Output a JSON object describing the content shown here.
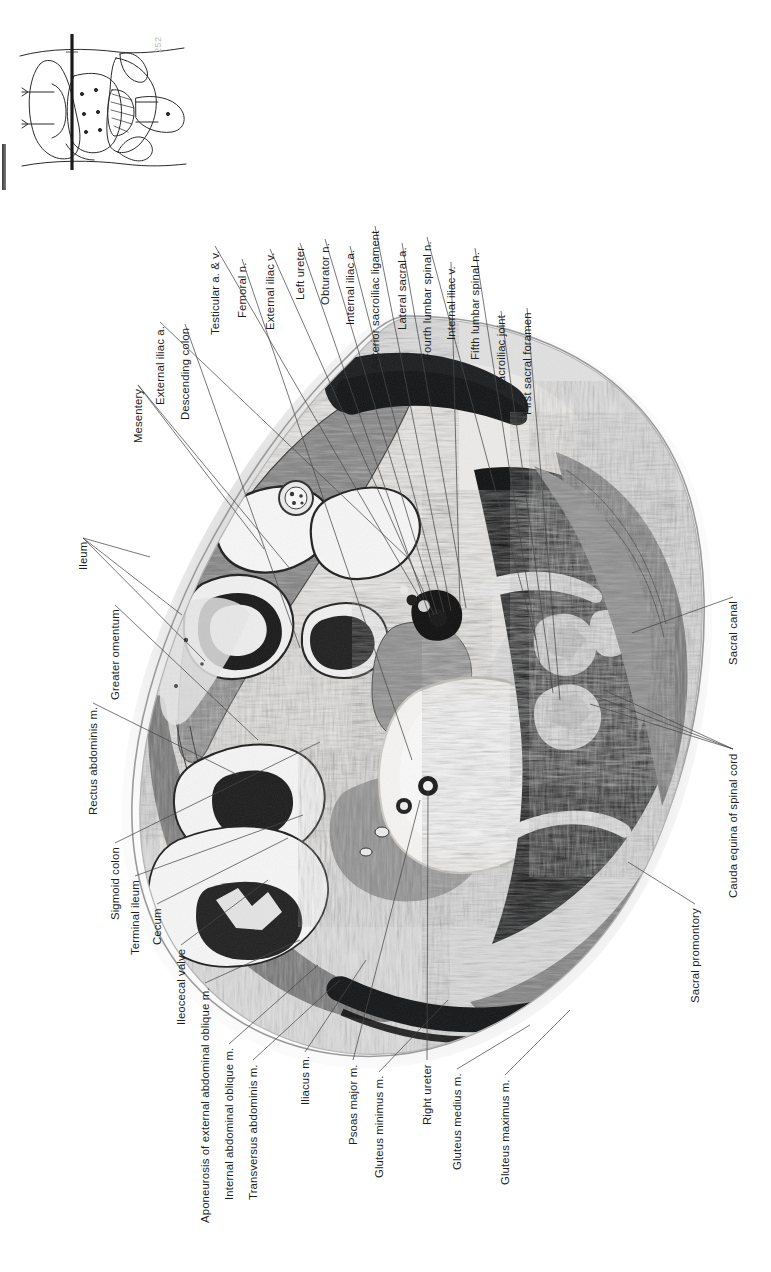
{
  "plate": {
    "title": "Transverse section of male pelvis at level of sacral promontory",
    "folio": "252",
    "inset_caption": "section level indicator"
  },
  "labels": [
    {
      "id": "ileum",
      "text": "Ileum",
      "x": 78,
      "y": 570,
      "anchors": [
        [
          150,
          557
        ],
        [
          182,
          615
        ],
        [
          205,
          661
        ]
      ]
    },
    {
      "id": "greater-omentum",
      "text": "Greater omentum",
      "x": 110,
      "y": 700,
      "anchors": [
        [
          258,
          740
        ]
      ]
    },
    {
      "id": "rectus-abdominis",
      "text": "Rectus abdominis m.",
      "x": 88,
      "y": 815,
      "anchors": [
        [
          238,
          775
        ]
      ]
    },
    {
      "id": "sigmoid-colon",
      "text": "Sigmoid colon",
      "x": 110,
      "y": 920,
      "anchors": [
        [
          320,
          742
        ]
      ]
    },
    {
      "id": "terminal-ileum",
      "text": "Terminal ileum",
      "x": 130,
      "y": 955,
      "anchors": [
        [
          303,
          815
        ]
      ]
    },
    {
      "id": "cecum",
      "text": "Cecum",
      "x": 152,
      "y": 945,
      "anchors": [
        [
          288,
          838
        ]
      ]
    },
    {
      "id": "ileocecal-valve",
      "text": "Ileocecal valve",
      "x": 176,
      "y": 1025,
      "anchors": [
        [
          268,
          880
        ]
      ]
    },
    {
      "id": "aponeurosis-eo",
      "text": "Aponeurosis of external abdominal oblique m.",
      "x": 200,
      "y": 1223,
      "anchors": [
        [
          300,
          940
        ]
      ]
    },
    {
      "id": "internal-oblique",
      "text": "Internal abdominal oblique m.",
      "x": 224,
      "y": 1200,
      "anchors": [
        [
          318,
          965
        ]
      ]
    },
    {
      "id": "transversus-abdominis",
      "text": "Transversus abdominis m.",
      "x": 248,
      "y": 1200,
      "anchors": [
        [
          340,
          980
        ]
      ]
    },
    {
      "id": "iliacus",
      "text": "Iliacus m.",
      "x": 300,
      "y": 1105,
      "anchors": [
        [
          366,
          960
        ]
      ]
    },
    {
      "id": "psoas-major",
      "text": "Psoas major m.",
      "x": 348,
      "y": 1145,
      "anchors": [
        [
          420,
          800
        ]
      ]
    },
    {
      "id": "gluteus-minimus",
      "text": "Gluteus minimus m.",
      "x": 374,
      "y": 1178,
      "anchors": [
        [
          448,
          1000
        ]
      ]
    },
    {
      "id": "right-ureter",
      "text": "Right ureter",
      "x": 422,
      "y": 1125,
      "anchors": [
        [
          428,
          790
        ]
      ]
    },
    {
      "id": "gluteus-medius",
      "text": "Gluteus medius m.",
      "x": 452,
      "y": 1170,
      "anchors": [
        [
          530,
          1025
        ]
      ]
    },
    {
      "id": "gluteus-maximus",
      "text": "Gluteus maximus m.",
      "x": 500,
      "y": 1185,
      "anchors": [
        [
          570,
          1010
        ]
      ]
    },
    {
      "id": "mesentery",
      "text": "Mesentery",
      "x": 133,
      "y": 443,
      "anchors": [
        [
          264,
          549
        ],
        [
          291,
          570
        ]
      ]
    },
    {
      "id": "external-iliac-a",
      "text": "External iliac a.",
      "x": 155,
      "y": 405,
      "anchors": [
        [
          410,
          560
        ]
      ]
    },
    {
      "id": "descending-colon",
      "text": "Descending colon",
      "x": 180,
      "y": 420,
      "anchors": [
        [
          300,
          648
        ]
      ]
    },
    {
      "id": "testicular-av",
      "text": "Testicular a. & v.",
      "x": 210,
      "y": 335,
      "anchors": [
        [
          421,
          600
        ]
      ]
    },
    {
      "id": "femoral-n",
      "text": "Femoral n.",
      "x": 237,
      "y": 318,
      "anchors": [
        [
          412,
          760
        ]
      ]
    },
    {
      "id": "external-iliac-v",
      "text": "External iliac v.",
      "x": 265,
      "y": 330,
      "anchors": [
        [
          434,
          615
        ]
      ]
    },
    {
      "id": "left-ureter",
      "text": "Left ureter",
      "x": 295,
      "y": 300,
      "anchors": [
        [
          430,
          617
        ]
      ]
    },
    {
      "id": "obturator-n",
      "text": "Obturator n.",
      "x": 320,
      "y": 305,
      "anchors": [
        [
          437,
          614
        ]
      ]
    },
    {
      "id": "internal-iliac-a",
      "text": "Internal iliac a.",
      "x": 345,
      "y": 325,
      "anchors": [
        [
          444,
          612
        ]
      ]
    },
    {
      "id": "anterior-si-ligament",
      "text": "Anterior sacroiliac ligament",
      "x": 370,
      "y": 370,
      "anchors": [
        [
          451,
          611
        ]
      ]
    },
    {
      "id": "lateral-sacral-a",
      "text": "Lateral sacral a.",
      "x": 397,
      "y": 330,
      "anchors": [
        [
          466,
          608
        ]
      ]
    },
    {
      "id": "fourth-lumbar-spinal-n",
      "text": "Fourth lumbar spinal n.",
      "x": 422,
      "y": 360,
      "anchors": [
        [
          536,
          640
        ]
      ]
    },
    {
      "id": "internal-iliac-v",
      "text": "Internal iliac v.",
      "x": 446,
      "y": 340,
      "anchors": [
        [
          460,
          608
        ]
      ]
    },
    {
      "id": "fifth-lumbar-spinal-n",
      "text": "Fifth lumbar spinal n.",
      "x": 470,
      "y": 360,
      "anchors": [
        [
          540,
          665
        ]
      ]
    },
    {
      "id": "sacroiliac-joint",
      "text": "Sacroiliac joint",
      "x": 496,
      "y": 390,
      "anchors": [
        [
          553,
          693
        ]
      ]
    },
    {
      "id": "first-sacral-foramen",
      "text": "First sacral foramen",
      "x": 522,
      "y": 415,
      "anchors": [
        [
          560,
          700
        ]
      ]
    },
    {
      "id": "sacral-canal",
      "text": "Sacral canal",
      "x": 728,
      "y": 665,
      "anchors": [
        [
          632,
          633
        ]
      ]
    },
    {
      "id": "cauda-equina",
      "text": "Cauda equina of spinal cord",
      "x": 728,
      "y": 898,
      "anchors": [
        [
          604,
          690
        ],
        [
          597,
          697
        ],
        [
          590,
          704
        ]
      ]
    },
    {
      "id": "sacral-promontory",
      "text": "Sacral promontory",
      "x": 690,
      "y": 1003,
      "anchors": [
        [
          628,
          862
        ]
      ]
    }
  ],
  "colors": {
    "ink": "#1d1d1d",
    "leader": "#4a4a4a",
    "folio": "#b9b9b9",
    "binding": "#3a3a3a"
  }
}
